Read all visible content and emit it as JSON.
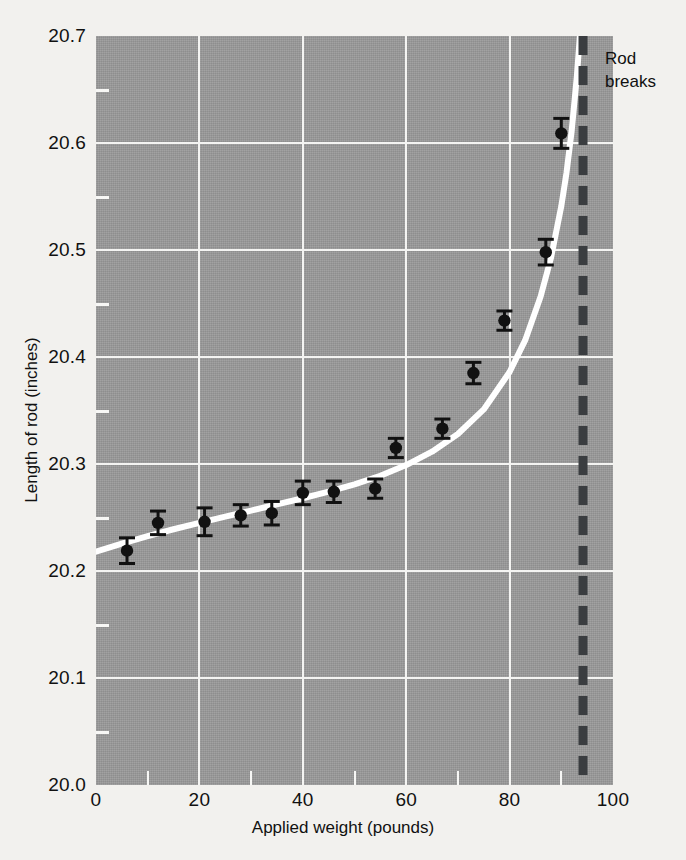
{
  "chart_data": {
    "type": "scatter",
    "title": "",
    "xlabel": "Applied weight (pounds)",
    "ylabel": "Length of rod (inches)",
    "xlim": [
      0,
      100
    ],
    "ylim": [
      20.0,
      20.7
    ],
    "grid": true,
    "legend": null,
    "x_ticks": [
      0,
      20,
      40,
      60,
      80,
      100
    ],
    "x_tick_labels": [
      "0",
      "20",
      "40",
      "60",
      "80",
      "100"
    ],
    "x_minor_ticks": [
      10,
      30,
      50,
      70,
      90
    ],
    "y_ticks": [
      20.0,
      20.1,
      20.2,
      20.3,
      20.4,
      20.5,
      20.6,
      20.7
    ],
    "y_tick_labels": [
      "20.0",
      "20.1",
      "20.2",
      "20.3",
      "20.4",
      "20.5",
      "20.6",
      "20.7"
    ],
    "y_minor_ticks": [
      20.05,
      20.15,
      20.25,
      20.35,
      20.45,
      20.55,
      20.65
    ],
    "points": [
      {
        "x": 6,
        "y": 20.219,
        "yerr": 0.012
      },
      {
        "x": 12,
        "y": 20.245,
        "yerr": 0.011
      },
      {
        "x": 21,
        "y": 20.246,
        "yerr": 0.013
      },
      {
        "x": 28,
        "y": 20.252,
        "yerr": 0.01
      },
      {
        "x": 34,
        "y": 20.254,
        "yerr": 0.011
      },
      {
        "x": 40,
        "y": 20.273,
        "yerr": 0.011
      },
      {
        "x": 46,
        "y": 20.274,
        "yerr": 0.01
      },
      {
        "x": 54,
        "y": 20.277,
        "yerr": 0.009
      },
      {
        "x": 58,
        "y": 20.315,
        "yerr": 0.009
      },
      {
        "x": 67,
        "y": 20.333,
        "yerr": 0.009
      },
      {
        "x": 73,
        "y": 20.385,
        "yerr": 0.01
      },
      {
        "x": 79,
        "y": 20.434,
        "yerr": 0.009
      },
      {
        "x": 87,
        "y": 20.498,
        "yerr": 0.012
      },
      {
        "x": 90,
        "y": 20.609,
        "yerr": 0.014
      }
    ],
    "fit_curve": {
      "name": "fitted curve",
      "color": "#ffffff",
      "x": [
        0,
        5,
        10,
        15,
        20,
        25,
        30,
        35,
        40,
        45,
        50,
        55,
        60,
        65,
        70,
        75,
        80,
        83,
        86,
        88,
        90,
        91,
        92,
        93,
        93.6
      ],
      "y": [
        20.218,
        20.2255,
        20.2325,
        20.239,
        20.245,
        20.2508,
        20.2565,
        20.2622,
        20.268,
        20.2742,
        20.281,
        20.289,
        20.299,
        20.3115,
        20.328,
        20.351,
        20.386,
        20.4155,
        20.4565,
        20.4925,
        20.541,
        20.572,
        20.611,
        20.662,
        20.7
      ]
    },
    "vline": {
      "x": 94.2,
      "style": "dashed",
      "color": "#3a3d40",
      "label_line1": "Rod",
      "label_line2": "breaks"
    },
    "colors": {
      "plot_background": "#9a9a9a",
      "page_background": "#f2f1ee",
      "grid": "#f4f4f2",
      "marker": "#111111",
      "curve": "#ffffff",
      "vline": "#3a3d40"
    }
  }
}
